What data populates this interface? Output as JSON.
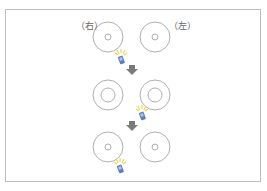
{
  "labels": {
    "right": "（右）",
    "left": "（左）"
  },
  "colors": {
    "frame": "#bdbdbd",
    "circle": "#9a9a9a",
    "arrow": "#7a7a7a",
    "device_body": "#5b7fc0",
    "device_light": "#e8d85a"
  },
  "rows": [
    {
      "step": 1,
      "inner_ring": "small",
      "device_position": "below-left-circle"
    },
    {
      "step": 2,
      "inner_ring": "large",
      "device_position": "below-right-circle"
    },
    {
      "step": 3,
      "inner_ring": "small",
      "device_position": "below-left-circle"
    }
  ]
}
